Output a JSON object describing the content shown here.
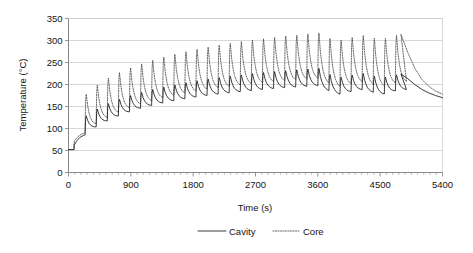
{
  "chart_data": {
    "type": "line",
    "title": "",
    "xlabel": "Time (s)",
    "ylabel": "Temperature (°C)",
    "xlim": [
      0,
      5400
    ],
    "ylim": [
      0,
      350
    ],
    "xticks": [
      0,
      900,
      1800,
      2700,
      3600,
      4500,
      5400
    ],
    "yticks": [
      0,
      50,
      100,
      150,
      200,
      250,
      300,
      350
    ],
    "xtick_labels": [
      "0",
      "900",
      "1800",
      "2700",
      "3600",
      "4500",
      "5400"
    ],
    "ytick_labels": [
      "0",
      "50",
      "100",
      "150",
      "200",
      "250",
      "300",
      "350"
    ],
    "x_minor_tick_interval": 90,
    "grid": "horizontal",
    "legend_position": "bottom-center",
    "legend": [
      {
        "name": "Cavity",
        "style": "solid",
        "color": "#262626"
      },
      {
        "name": "Core",
        "style": "dotted",
        "color": "#4d4d4d"
      }
    ],
    "cycle_period_s": 160,
    "cycles": 30,
    "cycling_end_s": 4800,
    "series": [
      {
        "name": "Cavity",
        "style": "solid",
        "envelope_peak": [
          {
            "t": 0,
            "v": 52
          },
          {
            "t": 80,
            "v": 52
          },
          {
            "t": 160,
            "v": 118
          },
          {
            "t": 320,
            "v": 136
          },
          {
            "t": 480,
            "v": 150
          },
          {
            "t": 640,
            "v": 161
          },
          {
            "t": 800,
            "v": 170
          },
          {
            "t": 960,
            "v": 178
          },
          {
            "t": 1120,
            "v": 185
          },
          {
            "t": 1280,
            "v": 191
          },
          {
            "t": 1440,
            "v": 196
          },
          {
            "t": 1600,
            "v": 201
          },
          {
            "t": 1760,
            "v": 206
          },
          {
            "t": 1920,
            "v": 210
          },
          {
            "t": 2080,
            "v": 214
          },
          {
            "t": 2240,
            "v": 217
          },
          {
            "t": 2400,
            "v": 220
          },
          {
            "t": 2560,
            "v": 223
          },
          {
            "t": 2720,
            "v": 226
          },
          {
            "t": 2880,
            "v": 228
          },
          {
            "t": 3040,
            "v": 230
          },
          {
            "t": 3200,
            "v": 232
          },
          {
            "t": 3360,
            "v": 234
          },
          {
            "t": 3520,
            "v": 236
          },
          {
            "t": 3680,
            "v": 237
          },
          {
            "t": 3840,
            "v": 213
          },
          {
            "t": 4000,
            "v": 219
          },
          {
            "t": 4160,
            "v": 223
          },
          {
            "t": 4320,
            "v": 226
          },
          {
            "t": 4480,
            "v": 214
          },
          {
            "t": 4640,
            "v": 219
          },
          {
            "t": 4800,
            "v": 224
          }
        ],
        "envelope_trough": [
          {
            "t": 0,
            "v": 52
          },
          {
            "t": 160,
            "v": 78
          },
          {
            "t": 320,
            "v": 95
          },
          {
            "t": 480,
            "v": 110
          },
          {
            "t": 640,
            "v": 122
          },
          {
            "t": 800,
            "v": 132
          },
          {
            "t": 960,
            "v": 141
          },
          {
            "t": 1120,
            "v": 148
          },
          {
            "t": 1280,
            "v": 154
          },
          {
            "t": 1440,
            "v": 159
          },
          {
            "t": 1600,
            "v": 164
          },
          {
            "t": 1760,
            "v": 168
          },
          {
            "t": 1920,
            "v": 172
          },
          {
            "t": 2080,
            "v": 175
          },
          {
            "t": 2240,
            "v": 178
          },
          {
            "t": 2400,
            "v": 181
          },
          {
            "t": 2560,
            "v": 183
          },
          {
            "t": 2720,
            "v": 186
          },
          {
            "t": 2880,
            "v": 188
          },
          {
            "t": 3040,
            "v": 190
          },
          {
            "t": 3200,
            "v": 192
          },
          {
            "t": 3360,
            "v": 193
          },
          {
            "t": 3520,
            "v": 195
          },
          {
            "t": 3680,
            "v": 196
          },
          {
            "t": 3840,
            "v": 172
          },
          {
            "t": 4000,
            "v": 180
          },
          {
            "t": 4160,
            "v": 185
          },
          {
            "t": 4320,
            "v": 189
          },
          {
            "t": 4480,
            "v": 172
          },
          {
            "t": 4640,
            "v": 181
          },
          {
            "t": 4800,
            "v": 187
          }
        ],
        "cooldown": [
          {
            "t": 4800,
            "v": 224
          },
          {
            "t": 4900,
            "v": 213
          },
          {
            "t": 5000,
            "v": 200
          },
          {
            "t": 5100,
            "v": 189
          },
          {
            "t": 5200,
            "v": 181
          },
          {
            "t": 5300,
            "v": 175
          },
          {
            "t": 5400,
            "v": 170
          }
        ]
      },
      {
        "name": "Core",
        "style": "dotted",
        "envelope_peak": [
          {
            "t": 0,
            "v": 52
          },
          {
            "t": 80,
            "v": 52
          },
          {
            "t": 160,
            "v": 163
          },
          {
            "t": 320,
            "v": 188
          },
          {
            "t": 480,
            "v": 206
          },
          {
            "t": 640,
            "v": 220
          },
          {
            "t": 800,
            "v": 232
          },
          {
            "t": 960,
            "v": 242
          },
          {
            "t": 1120,
            "v": 250
          },
          {
            "t": 1280,
            "v": 258
          },
          {
            "t": 1440,
            "v": 265
          },
          {
            "t": 1600,
            "v": 271
          },
          {
            "t": 1760,
            "v": 277
          },
          {
            "t": 1920,
            "v": 282
          },
          {
            "t": 2080,
            "v": 287
          },
          {
            "t": 2240,
            "v": 291
          },
          {
            "t": 2400,
            "v": 295
          },
          {
            "t": 2560,
            "v": 299
          },
          {
            "t": 2720,
            "v": 302
          },
          {
            "t": 2880,
            "v": 305
          },
          {
            "t": 3040,
            "v": 308
          },
          {
            "t": 3200,
            "v": 311
          },
          {
            "t": 3360,
            "v": 313
          },
          {
            "t": 3520,
            "v": 316
          },
          {
            "t": 3680,
            "v": 318
          },
          {
            "t": 3840,
            "v": 296
          },
          {
            "t": 4000,
            "v": 304
          },
          {
            "t": 4160,
            "v": 309
          },
          {
            "t": 4320,
            "v": 313
          },
          {
            "t": 4480,
            "v": 300
          },
          {
            "t": 4640,
            "v": 308
          },
          {
            "t": 4800,
            "v": 314
          }
        ],
        "envelope_trough": [
          {
            "t": 0,
            "v": 52
          },
          {
            "t": 160,
            "v": 82
          },
          {
            "t": 320,
            "v": 100
          },
          {
            "t": 480,
            "v": 115
          },
          {
            "t": 640,
            "v": 128
          },
          {
            "t": 800,
            "v": 139
          },
          {
            "t": 960,
            "v": 148
          },
          {
            "t": 1120,
            "v": 156
          },
          {
            "t": 1280,
            "v": 163
          },
          {
            "t": 1440,
            "v": 169
          },
          {
            "t": 1600,
            "v": 174
          },
          {
            "t": 1760,
            "v": 179
          },
          {
            "t": 1920,
            "v": 183
          },
          {
            "t": 2080,
            "v": 187
          },
          {
            "t": 2240,
            "v": 190
          },
          {
            "t": 2400,
            "v": 193
          },
          {
            "t": 2560,
            "v": 196
          },
          {
            "t": 2720,
            "v": 199
          },
          {
            "t": 2880,
            "v": 201
          },
          {
            "t": 3040,
            "v": 203
          },
          {
            "t": 3200,
            "v": 205
          },
          {
            "t": 3360,
            "v": 207
          },
          {
            "t": 3520,
            "v": 209
          },
          {
            "t": 3680,
            "v": 210
          },
          {
            "t": 3840,
            "v": 186
          },
          {
            "t": 4000,
            "v": 195
          },
          {
            "t": 4160,
            "v": 200
          },
          {
            "t": 4320,
            "v": 204
          },
          {
            "t": 4480,
            "v": 187
          },
          {
            "t": 4640,
            "v": 196
          },
          {
            "t": 4800,
            "v": 202
          }
        ],
        "cooldown": [
          {
            "t": 4800,
            "v": 314
          },
          {
            "t": 4900,
            "v": 272
          },
          {
            "t": 5000,
            "v": 237
          },
          {
            "t": 5100,
            "v": 212
          },
          {
            "t": 5200,
            "v": 196
          },
          {
            "t": 5300,
            "v": 185
          },
          {
            "t": 5400,
            "v": 178
          }
        ]
      }
    ]
  }
}
